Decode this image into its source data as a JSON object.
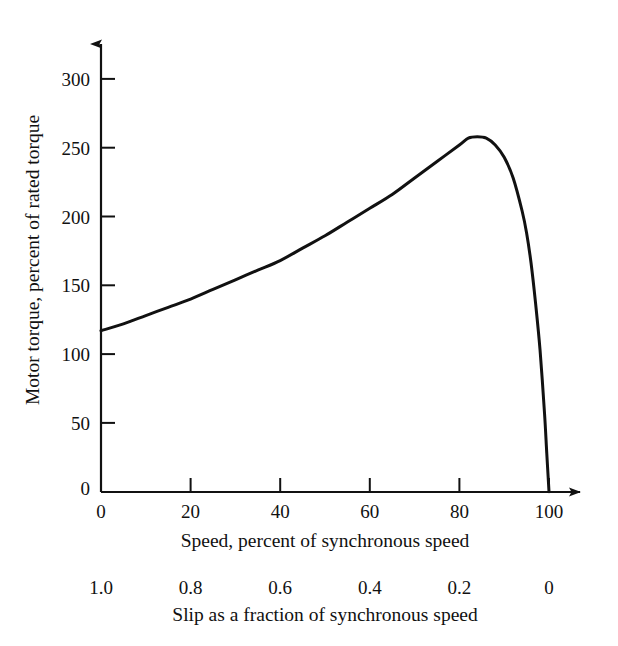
{
  "chart_data": {
    "type": "line",
    "title": "",
    "xlabel": "Speed, percent of synchronous speed",
    "ylabel": "Motor torque, percent of rated torque",
    "secondary_xlabel": "Slip as a fraction of synchronous speed",
    "grid": false,
    "legend": "none",
    "xlim": [
      0,
      100
    ],
    "ylim": [
      0,
      300
    ],
    "xticks": [
      0,
      20,
      40,
      60,
      80,
      100
    ],
    "xticklabels": [
      "0",
      "20",
      "40",
      "60",
      "80",
      "100"
    ],
    "yticks": [
      0,
      50,
      100,
      150,
      200,
      250,
      300
    ],
    "yticklabels": [
      "0",
      "50",
      "100",
      "150",
      "200",
      "250",
      "300"
    ],
    "secondary_xticks": [
      0,
      20,
      40,
      60,
      80,
      100
    ],
    "secondary_xticklabels": [
      "1.0",
      "0.8",
      "0.6",
      "0.4",
      "0.2",
      "0"
    ],
    "series": [
      {
        "name": "Motor torque characteristic",
        "color": "#111111",
        "x": [
          0,
          5,
          10,
          15,
          20,
          25,
          30,
          35,
          40,
          45,
          50,
          55,
          60,
          65,
          70,
          75,
          80,
          82,
          84,
          86,
          88,
          90,
          92,
          94,
          95,
          96,
          97,
          98,
          99,
          99.5,
          100
        ],
        "y": [
          117,
          122,
          128,
          134,
          140,
          147,
          154,
          161,
          168,
          177,
          186,
          196,
          206,
          216,
          228,
          240,
          252,
          257,
          258,
          257,
          252,
          243,
          228,
          204,
          188,
          166,
          137,
          103,
          57,
          28,
          0
        ]
      }
    ]
  },
  "axes": {
    "y_axis_title": "Motor torque, percent of rated torque",
    "x_axis_caption": "Speed, percent of synchronous speed",
    "slip_axis_caption": "Slip as a fraction of synchronous speed",
    "y_tick_labels": [
      "300",
      "250",
      "200",
      "150",
      "100",
      "50",
      "0"
    ],
    "x_tick_labels": [
      "0",
      "20",
      "40",
      "60",
      "80",
      "100"
    ],
    "slip_tick_labels": [
      "1.0",
      "0.8",
      "0.6",
      "0.4",
      "0.2",
      "0"
    ]
  },
  "colors": {
    "background": "#ffffff",
    "axis": "#111111",
    "curve": "#111111",
    "text": "#111111"
  }
}
